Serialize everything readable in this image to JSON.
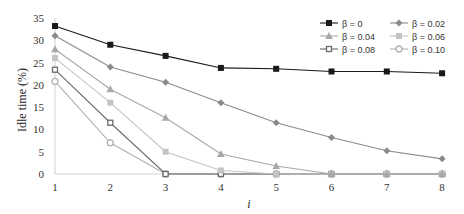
{
  "chart_data": {
    "type": "line",
    "title": "",
    "xlabel": "i",
    "ylabel": "Idle time (%)",
    "x": [
      1,
      2,
      3,
      4,
      5,
      6,
      7,
      8
    ],
    "ylim": [
      0,
      35
    ],
    "yticks": [
      0,
      5,
      10,
      15,
      20,
      25,
      30,
      35
    ],
    "grid": false,
    "legend_position": "top-right",
    "series": [
      {
        "name": "β = 0",
        "color": "#1a1a1a",
        "marker": "square-filled",
        "values": [
          33.2,
          29.0,
          26.5,
          23.8,
          23.6,
          23.0,
          23.0,
          22.6
        ]
      },
      {
        "name": "β = 0.02",
        "color": "#8a8a8a",
        "marker": "diamond",
        "values": [
          31.0,
          24.0,
          20.6,
          16.0,
          11.5,
          8.2,
          5.2,
          3.4
        ]
      },
      {
        "name": "β = 0.04",
        "color": "#a8a8a8",
        "marker": "triangle",
        "values": [
          28.0,
          19.0,
          12.6,
          4.5,
          1.8,
          0,
          0,
          0
        ]
      },
      {
        "name": "β = 0.06",
        "color": "#c4c4c4",
        "marker": "square-light",
        "values": [
          26.0,
          16.0,
          5.0,
          0.8,
          0,
          0,
          0,
          0
        ]
      },
      {
        "name": "β = 0.08",
        "color": "#6a6a6a",
        "marker": "square-hollow",
        "values": [
          23.4,
          11.5,
          0,
          0,
          0,
          0,
          0,
          0
        ]
      },
      {
        "name": "β = 0.10",
        "color": "#b0b0b0",
        "marker": "circle-hollow",
        "values": [
          20.8,
          7.0,
          0,
          0,
          0,
          0,
          0,
          0
        ]
      }
    ]
  }
}
